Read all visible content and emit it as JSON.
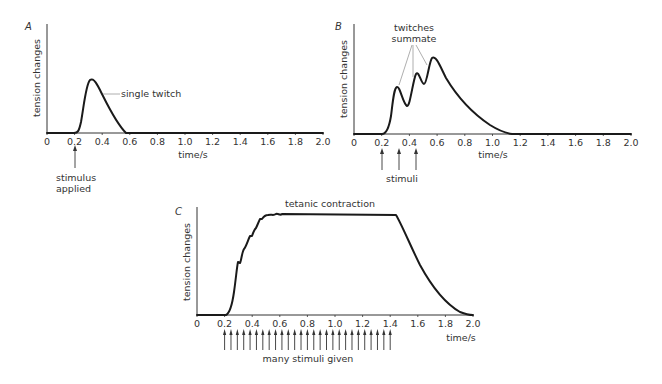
{
  "chart_data": [
    {
      "panel": "A",
      "type": "line",
      "title": "",
      "xlabel": "time/s",
      "ylabel": "tension changes",
      "xlim": [
        0,
        2.0
      ],
      "xticks": [
        "0",
        "0.2",
        "0.4",
        "0.6",
        "0.8",
        "1.0",
        "1.2",
        "1.4",
        "1.6",
        "1.8",
        "2.0"
      ],
      "series": [
        {
          "name": "single twitch",
          "x": [
            0,
            0.2,
            0.25,
            0.31,
            0.4,
            0.5,
            0.58,
            2.0
          ],
          "y": [
            0,
            0,
            0.45,
            0.5,
            0.3,
            0.08,
            0,
            0
          ]
        }
      ],
      "annotations": [
        {
          "text": "single twitch",
          "x": 0.4,
          "y": 0.36
        },
        {
          "text": "stimulus applied",
          "x": 0.2,
          "arrow": true
        }
      ],
      "stimuli_times": [
        0.2
      ]
    },
    {
      "panel": "B",
      "type": "line",
      "title": "",
      "xlabel": "time/s",
      "ylabel": "tension changes",
      "xlim": [
        0,
        2.0
      ],
      "xticks": [
        "0",
        "0.2",
        "0.4",
        "0.6",
        "0.8",
        "1.0",
        "1.2",
        "1.4",
        "1.6",
        "1.8",
        "2.0"
      ],
      "series": [
        {
          "name": "summation",
          "x": [
            0,
            0.2,
            0.31,
            0.38,
            0.45,
            0.51,
            0.57,
            0.8,
            1.1,
            2.0
          ],
          "y": [
            0,
            0,
            0.44,
            0.26,
            0.56,
            0.46,
            0.7,
            0.3,
            0,
            0
          ]
        }
      ],
      "annotations": [
        {
          "text": "twitches summate",
          "x": 0.42,
          "y": 0.95
        },
        {
          "text": "stimuli",
          "x": 0.3,
          "arrow": true
        }
      ],
      "stimuli_times": [
        0.2,
        0.32,
        0.45
      ]
    },
    {
      "panel": "C",
      "type": "line",
      "title": "",
      "xlabel": "time/s",
      "ylabel": "tension changes",
      "xlim": [
        0,
        2.0
      ],
      "xticks": [
        "0",
        "0.2",
        "0.4",
        "0.6",
        "0.8",
        "1.0",
        "1.2",
        "1.4",
        "1.6",
        "1.8",
        "2.0"
      ],
      "series": [
        {
          "name": "tetanic contraction",
          "x": [
            0,
            0.2,
            0.28,
            0.33,
            0.38,
            0.43,
            0.48,
            1.43,
            1.6,
            2.0
          ],
          "y": [
            0,
            0,
            0.49,
            0.6,
            0.74,
            0.85,
            0.93,
            0.93,
            0.55,
            0
          ]
        }
      ],
      "annotations": [
        {
          "text": "tetanic contraction",
          "x": 0.95,
          "y": 1.0
        },
        {
          "text": "many stimuli given",
          "x": 0.8,
          "arrow": true
        }
      ],
      "stimuli_count": 27,
      "stimuli_range": [
        0.2,
        1.4
      ]
    }
  ],
  "labels": {
    "A": {
      "panel": "A",
      "ylabel": "tension changes",
      "xlabel": "time/s",
      "annot": "single twitch",
      "stim1": "stimulus",
      "stim2": "applied"
    },
    "B": {
      "panel": "B",
      "ylabel": "tension changes",
      "xlabel": "time/s",
      "annot1": "twitches",
      "annot2": "summate",
      "stim": "stimuli"
    },
    "C": {
      "panel": "C",
      "ylabel": "tension changes",
      "xlabel": "time/s",
      "annot": "tetanic contraction",
      "stim": "many stimuli given"
    },
    "ticks": [
      "0",
      "0.2",
      "0.4",
      "0.6",
      "0.8",
      "1.0",
      "1.2",
      "1.4",
      "1.6",
      "1.8",
      "2.0"
    ]
  }
}
